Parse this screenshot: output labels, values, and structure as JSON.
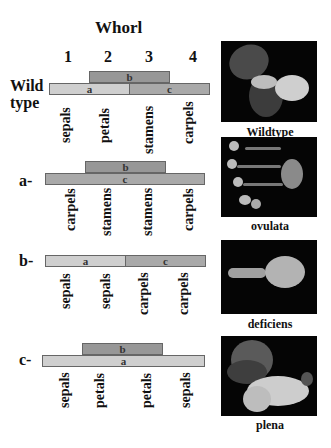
{
  "title": "Whorl",
  "whorls": [
    "1",
    "2",
    "3",
    "4"
  ],
  "rows": [
    {
      "label_line1": "Wild",
      "label_line2": "type",
      "bars": {
        "a": "a",
        "b": "b",
        "c": "c"
      },
      "organs": [
        "sepals",
        "petals",
        "stamens",
        "carpels"
      ],
      "photo_caption": "Wildtype"
    },
    {
      "label": "a-",
      "bars": {
        "b": "b",
        "c": "c"
      },
      "organs": [
        "carpels",
        "stamens",
        "stamens",
        "carpels"
      ],
      "photo_caption": "ovulata"
    },
    {
      "label": "b-",
      "bars": {
        "a": "a",
        "c": "c"
      },
      "organs": [
        "sepals",
        "sepals",
        "carpels",
        "carpels"
      ],
      "photo_caption": "deficiens"
    },
    {
      "label": "c-",
      "bars": {
        "b": "b",
        "a": "a"
      },
      "organs": [
        "sepals",
        "petals",
        "petals",
        "sepals"
      ],
      "photo_caption": "plena"
    }
  ],
  "colors": {
    "a_bar": "#cfcfcf",
    "b_bar": "#979797",
    "c_bar": "#a9a9a9",
    "photo_bg": "#050505"
  }
}
